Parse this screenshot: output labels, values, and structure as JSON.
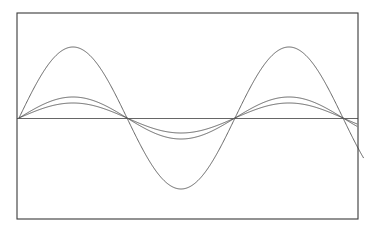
{
  "figure": {
    "background_color": "#ffffff",
    "frame": {
      "name": "plot-border",
      "x": 17,
      "y": 13,
      "width": 341,
      "height": 206,
      "stroke_color": "#3a3a3a",
      "stroke_width": 1.1,
      "visible": true
    }
  },
  "chart_data": {
    "type": "line",
    "title": "",
    "subtitle": "",
    "xlabel": "",
    "ylabel": "",
    "grid": false,
    "legend": false,
    "legend_position": "none",
    "xlim": [
      0,
      1.5
    ],
    "ylim": [
      -1.0,
      1.0
    ],
    "x_unit": "periods",
    "x_tick_labels": [],
    "y_tick_labels": [],
    "zero_line": {
      "label": "zero axis",
      "value": 0,
      "color": "#555555",
      "width": 0.9
    },
    "period_px": 216,
    "zero_crossings_px": [
      19,
      127,
      235,
      343
    ],
    "baseline_y_px": 118,
    "series": [
      {
        "name": "large amplitude sine",
        "amplitude": 1.0,
        "amplitude_px": 71,
        "phase": 0,
        "periods_shown": 1.5,
        "color": "#4a4a4a",
        "width": 0.85,
        "peak_y_px": 47,
        "trough_y_px": 195,
        "peak_x_px": [
          73,
          289
        ],
        "trough_x_px": [
          181
        ],
        "extends_past_right_edge": true
      },
      {
        "name": "medium amplitude sine",
        "amplitude": 0.3,
        "amplitude_px": 21,
        "phase": 0,
        "periods_shown": 1.5,
        "color": "#4a4a4a",
        "width": 0.85,
        "peak_y_px": 97,
        "trough_y_px": 139,
        "peak_x_px": [
          73,
          289
        ],
        "trough_x_px": [
          181
        ],
        "extends_past_right_edge": false
      },
      {
        "name": "small amplitude sine",
        "amplitude": 0.21,
        "amplitude_px": 15,
        "phase": 0,
        "periods_shown": 1.5,
        "color": "#4a4a4a",
        "width": 0.85,
        "peak_y_px": 103,
        "trough_y_px": 133,
        "peak_x_px": [
          73,
          289
        ],
        "trough_x_px": [
          181
        ],
        "extends_past_right_edge": false
      }
    ],
    "annotations": []
  }
}
